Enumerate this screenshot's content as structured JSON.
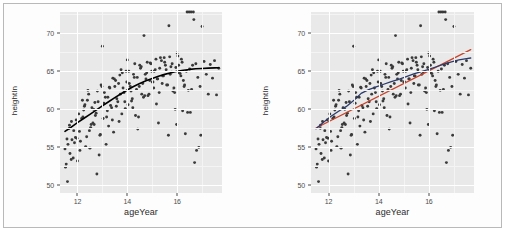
{
  "figure": {
    "background": "#ffffff",
    "frame_color": "#b9b9b9",
    "panel_background": "#e9e9e9",
    "gridline_color": "#ffffff",
    "point_color": "#3a3a3a"
  },
  "panels": [
    {
      "id": "left-panel",
      "xlabel": "ageYear",
      "ylabel": "heightIn",
      "xticks": [
        "12",
        "14",
        "16"
      ],
      "yticks": [
        "50",
        "55",
        "60",
        "65",
        "70"
      ]
    },
    {
      "id": "right-panel",
      "xlabel": "ageYear",
      "ylabel": "heightIn",
      "xticks": [
        "12",
        "14",
        "16"
      ],
      "yticks": [
        "50",
        "55",
        "60",
        "65",
        "70"
      ]
    }
  ],
  "chart_data": [
    {
      "type": "scatter",
      "id": "left-panel",
      "title": "",
      "xlabel": "ageYear",
      "ylabel": "heightIn",
      "xlim": [
        11.3,
        17.8
      ],
      "ylim": [
        49.0,
        72.8
      ],
      "xticks": [
        12,
        14,
        16
      ],
      "yticks": [
        50,
        55,
        60,
        65,
        70
      ],
      "grid": true,
      "legend": "none",
      "point_color": "#3a3a3a",
      "x": [
        11.92,
        12.0,
        12.08,
        12.17,
        12.25,
        12.33,
        12.42,
        12.5,
        12.58,
        12.67,
        11.5,
        11.58,
        11.67,
        11.75,
        11.83,
        12.75,
        12.83,
        12.92,
        13.0,
        13.08,
        13.17,
        13.25,
        13.33,
        13.42,
        13.5,
        13.58,
        13.67,
        13.75,
        13.83,
        13.92,
        14.0,
        14.08,
        14.17,
        14.25,
        14.33,
        14.42,
        14.5,
        14.58,
        14.67,
        14.75,
        14.83,
        14.92,
        15.0,
        15.08,
        15.17,
        15.25,
        15.33,
        15.42,
        15.5,
        15.58,
        15.67,
        15.75,
        15.83,
        15.92,
        16.0,
        16.08,
        16.17,
        16.25,
        16.33,
        16.42,
        16.5,
        16.58,
        16.67,
        16.75,
        16.83,
        16.92,
        17.0,
        17.08,
        17.17,
        17.25,
        17.33,
        17.42,
        17.5,
        17.58,
        17.67,
        11.55,
        11.62,
        11.7,
        11.78,
        11.85,
        11.95,
        12.05,
        12.12,
        12.2,
        12.28,
        12.37,
        12.45,
        12.53,
        12.62,
        12.7,
        12.78,
        12.87,
        12.95,
        13.03,
        13.12,
        13.2,
        13.28,
        13.37,
        13.45,
        13.53,
        13.62,
        13.7,
        13.78,
        13.87,
        13.95,
        14.03,
        14.12,
        14.2,
        14.28,
        14.37,
        14.45,
        14.53,
        14.62,
        14.7,
        14.78,
        14.87,
        14.95,
        15.03,
        15.12,
        15.2,
        15.28,
        15.37,
        15.45,
        15.53,
        15.62,
        15.7,
        15.78,
        15.87,
        15.95,
        16.03,
        16.12,
        16.2,
        16.28,
        16.37,
        16.45,
        16.53,
        16.62,
        16.7,
        16.78,
        16.87,
        16.95,
        11.52,
        11.6,
        11.68,
        11.76,
        11.88,
        11.98,
        12.1,
        12.22,
        12.3,
        12.4,
        12.48,
        12.55,
        12.65,
        12.72,
        12.8,
        12.9,
        12.98,
        13.06,
        13.15,
        13.22,
        13.3,
        13.4,
        13.48,
        13.56,
        13.65,
        13.72,
        13.8,
        13.9,
        13.98,
        14.06,
        14.15,
        14.22,
        14.3,
        14.4,
        14.48,
        14.56,
        14.65,
        14.72,
        14.8,
        14.9,
        14.98,
        15.06,
        15.15,
        15.22,
        15.3,
        15.4,
        15.48,
        15.56,
        15.65,
        15.72,
        15.8,
        15.9,
        15.98,
        16.06,
        16.15,
        16.22,
        16.3,
        16.4,
        16.48,
        16.56,
        16.65
      ],
      "y": [
        56.3,
        53.2,
        57.1,
        58.8,
        59.9,
        55.1,
        62.5,
        54.9,
        60.2,
        58.0,
        54.8,
        56.1,
        57.5,
        53.4,
        53.6,
        59.5,
        61.0,
        56.7,
        68.3,
        62.2,
        59.0,
        57.8,
        60.5,
        64.1,
        63.0,
        61.4,
        58.4,
        65.2,
        62.8,
        60.1,
        66.5,
        63.4,
        61.1,
        64.6,
        59.2,
        57.4,
        65.8,
        62.0,
        69.7,
        64.0,
        61.8,
        66.1,
        63.6,
        65.0,
        60.7,
        58.2,
        66.8,
        64.4,
        66.2,
        63.2,
        71.0,
        65.6,
        62.4,
        60.0,
        67.4,
        64.8,
        66.6,
        63.8,
        56.8,
        59.6,
        65.3,
        62.6,
        71.8,
        66.0,
        64.2,
        63.0,
        70.9,
        66.3,
        64.6,
        62.0,
        65.9,
        64.1,
        66.4,
        61.9,
        65.4,
        52.8,
        55.4,
        54.2,
        56.0,
        57.2,
        58.6,
        59.4,
        55.8,
        61.2,
        60.4,
        56.4,
        62.0,
        57.6,
        58.2,
        60.9,
        51.5,
        54.0,
        63.2,
        58.8,
        61.6,
        59.8,
        62.9,
        60.2,
        57.0,
        63.8,
        61.0,
        64.5,
        59.4,
        62.2,
        65.0,
        60.6,
        63.0,
        61.4,
        64.2,
        62.6,
        59.0,
        65.4,
        63.4,
        61.8,
        64.8,
        62.0,
        66.0,
        63.6,
        65.2,
        64.0,
        62.2,
        66.4,
        64.4,
        65.8,
        63.2,
        66.9,
        64.9,
        62.8,
        65.5,
        67.0,
        64.7,
        66.2,
        63.0,
        65.0,
        62.5,
        59.6,
        65.8,
        53.0,
        54.6,
        55.0,
        56.6,
        52.4,
        50.5,
        57.9,
        58.4,
        55.6,
        56.2,
        54.6,
        59.0,
        60.6,
        61.2,
        57.2,
        58.0,
        60.0,
        59.2,
        62.4,
        56.6,
        63.0,
        60.8,
        55.4,
        61.6,
        62.8,
        58.6,
        64.0,
        60.4,
        63.4,
        62.0,
        64.8,
        61.0,
        63.6,
        65.0,
        62.4,
        60.2,
        66.0,
        64.2,
        63.0,
        65.6,
        61.6,
        64.6,
        66.2,
        63.8,
        65.0,
        62.8,
        66.6,
        64.0,
        65.4,
        63.4,
        66.8,
        65.2,
        56.6,
        64.6,
        66.0,
        62.2,
        58.0,
        65.8,
        64.4,
        59.8,
        63.2
      ],
      "fits": [
        {
          "name": "loess",
          "color": "#000000",
          "width": 1.6,
          "x": [
            11.5,
            11.75,
            12.0,
            12.25,
            12.5,
            12.75,
            13.0,
            13.25,
            13.5,
            13.75,
            14.0,
            14.25,
            14.5,
            14.75,
            15.0,
            15.25,
            15.5,
            15.75,
            16.0,
            16.25,
            16.5,
            16.75,
            17.0,
            17.25,
            17.5,
            17.67
          ],
          "y": [
            57.1,
            57.65,
            58.25,
            58.8,
            59.35,
            59.9,
            60.45,
            61.0,
            61.55,
            62.05,
            62.55,
            63.0,
            63.4,
            63.75,
            64.05,
            64.35,
            64.6,
            64.82,
            65.0,
            65.15,
            65.25,
            65.33,
            65.38,
            65.42,
            65.45,
            65.46
          ]
        }
      ]
    },
    {
      "type": "scatter",
      "id": "right-panel",
      "title": "",
      "xlabel": "ageYear",
      "ylabel": "heightIn",
      "xlim": [
        11.3,
        17.8
      ],
      "ylim": [
        49.0,
        72.8
      ],
      "xticks": [
        12,
        14,
        16
      ],
      "yticks": [
        50,
        55,
        60,
        65,
        70
      ],
      "grid": true,
      "legend": "none",
      "point_color": "#3a3a3a",
      "x": [
        11.92,
        12.0,
        12.08,
        12.17,
        12.25,
        12.33,
        12.42,
        12.5,
        12.58,
        12.67,
        11.5,
        11.58,
        11.67,
        11.75,
        11.83,
        12.75,
        12.83,
        12.92,
        13.0,
        13.08,
        13.17,
        13.25,
        13.33,
        13.42,
        13.5,
        13.58,
        13.67,
        13.75,
        13.83,
        13.92,
        14.0,
        14.08,
        14.17,
        14.25,
        14.33,
        14.42,
        14.5,
        14.58,
        14.67,
        14.75,
        14.83,
        14.92,
        15.0,
        15.08,
        15.17,
        15.25,
        15.33,
        15.42,
        15.5,
        15.58,
        15.67,
        15.75,
        15.83,
        15.92,
        16.0,
        16.08,
        16.17,
        16.25,
        16.33,
        16.42,
        16.5,
        16.58,
        16.67,
        16.75,
        16.83,
        16.92,
        17.0,
        17.08,
        17.17,
        17.25,
        17.33,
        17.42,
        17.5,
        17.58,
        17.67,
        11.55,
        11.62,
        11.7,
        11.78,
        11.85,
        11.95,
        12.05,
        12.12,
        12.2,
        12.28,
        12.37,
        12.45,
        12.53,
        12.62,
        12.7,
        12.78,
        12.87,
        12.95,
        13.03,
        13.12,
        13.2,
        13.28,
        13.37,
        13.45,
        13.53,
        13.62,
        13.7,
        13.78,
        13.87,
        13.95,
        14.03,
        14.12,
        14.2,
        14.28,
        14.37,
        14.45,
        14.53,
        14.62,
        14.7,
        14.78,
        14.87,
        14.95,
        15.03,
        15.12,
        15.2,
        15.28,
        15.37,
        15.45,
        15.53,
        15.62,
        15.7,
        15.78,
        15.87,
        15.95,
        16.03,
        16.12,
        16.2,
        16.28,
        16.37,
        16.45,
        16.53,
        16.62,
        16.7,
        16.78,
        16.87,
        16.95,
        11.52,
        11.6,
        11.68,
        11.76,
        11.88,
        11.98,
        12.1,
        12.22,
        12.3,
        12.4,
        12.48,
        12.55,
        12.65,
        12.72,
        12.8,
        12.9,
        12.98,
        13.06,
        13.15,
        13.22,
        13.3,
        13.4,
        13.48,
        13.56,
        13.65,
        13.72,
        13.8,
        13.9,
        13.98,
        14.06,
        14.15,
        14.22,
        14.3,
        14.4,
        14.48,
        14.56,
        14.65,
        14.72,
        14.8,
        14.9,
        14.98,
        15.06,
        15.15,
        15.22,
        15.3,
        15.4,
        15.48,
        15.56,
        15.65,
        15.72,
        15.8,
        15.9,
        15.98,
        16.06,
        16.15,
        16.22,
        16.3,
        16.4,
        16.48,
        16.56,
        16.65
      ],
      "y": [
        56.3,
        53.2,
        57.1,
        58.8,
        59.9,
        55.1,
        62.5,
        54.9,
        60.2,
        58.0,
        54.8,
        56.1,
        57.5,
        53.4,
        53.6,
        59.5,
        61.0,
        56.7,
        68.3,
        62.2,
        59.0,
        57.8,
        60.5,
        64.1,
        63.0,
        61.4,
        58.4,
        65.2,
        62.8,
        60.1,
        66.5,
        63.4,
        61.1,
        64.6,
        59.2,
        57.4,
        65.8,
        62.0,
        69.7,
        64.0,
        61.8,
        66.1,
        63.6,
        65.0,
        60.7,
        58.2,
        66.8,
        64.4,
        66.2,
        63.2,
        71.0,
        65.6,
        62.4,
        60.0,
        67.4,
        64.8,
        66.6,
        63.8,
        56.8,
        59.6,
        65.3,
        62.6,
        71.8,
        66.0,
        64.2,
        63.0,
        70.9,
        66.3,
        64.6,
        62.0,
        65.9,
        64.1,
        66.4,
        61.9,
        65.4,
        52.8,
        55.4,
        54.2,
        56.0,
        57.2,
        58.6,
        59.4,
        55.8,
        61.2,
        60.4,
        56.4,
        62.0,
        57.6,
        58.2,
        60.9,
        51.5,
        54.0,
        63.2,
        58.8,
        61.6,
        59.8,
        62.9,
        60.2,
        57.0,
        63.8,
        61.0,
        64.5,
        59.4,
        62.2,
        65.0,
        60.6,
        63.0,
        61.4,
        64.2,
        62.6,
        59.0,
        65.4,
        63.4,
        61.8,
        64.8,
        62.0,
        66.0,
        63.6,
        65.2,
        64.0,
        62.2,
        66.4,
        64.4,
        65.8,
        63.2,
        66.9,
        64.9,
        62.8,
        65.5,
        67.0,
        64.7,
        66.2,
        63.0,
        65.0,
        62.5,
        59.6,
        65.8,
        53.0,
        54.6,
        55.0,
        56.6,
        52.4,
        50.5,
        57.9,
        58.4,
        55.6,
        56.2,
        54.6,
        59.0,
        60.6,
        61.2,
        57.2,
        58.0,
        60.0,
        59.2,
        62.4,
        56.6,
        63.0,
        60.8,
        55.4,
        61.6,
        62.8,
        58.6,
        64.0,
        60.4,
        63.4,
        62.0,
        64.8,
        61.0,
        63.6,
        65.0,
        62.4,
        60.2,
        66.0,
        64.2,
        63.0,
        65.6,
        61.6,
        64.6,
        66.2,
        63.8,
        65.0,
        62.8,
        66.6,
        64.0,
        65.4,
        63.4,
        66.8,
        65.2,
        56.6,
        64.6,
        66.0,
        62.2,
        58.0,
        65.8,
        64.4,
        59.8,
        63.2
      ],
      "fits": [
        {
          "name": "linear-fit",
          "color": "#c8432a",
          "width": 1.3,
          "x": [
            11.5,
            17.67
          ],
          "y": [
            57.55,
            67.85
          ]
        },
        {
          "name": "loess-fit",
          "color": "#2b3b6b",
          "width": 1.3,
          "x": [
            11.5,
            11.8,
            12.1,
            12.4,
            12.7,
            13.0,
            13.3,
            13.6,
            13.9,
            14.2,
            14.5,
            14.8,
            15.1,
            15.4,
            15.7,
            16.0,
            16.3,
            16.6,
            16.9,
            17.2,
            17.5,
            17.67
          ],
          "y": [
            57.45,
            58.3,
            59.1,
            59.75,
            60.35,
            61.15,
            62.1,
            62.6,
            62.95,
            63.3,
            63.65,
            63.95,
            64.3,
            64.65,
            64.95,
            65.25,
            65.6,
            65.95,
            66.25,
            66.5,
            66.68,
            66.75
          ]
        }
      ]
    }
  ]
}
